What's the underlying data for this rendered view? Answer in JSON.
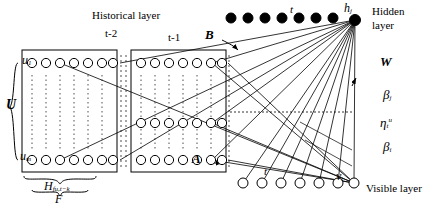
{
  "diagram": {
    "labels": {
      "historical_layer": "Historical layer",
      "t_minus_2": "t-2",
      "t_minus_1": "t-1",
      "t_top": "t",
      "hidden_layer_line1": "Hidden",
      "hidden_layer_line2": "layer",
      "visible_layer": "Visible layer",
      "B": "B",
      "W": "W",
      "U": "U",
      "A": "A",
      "t_bottom": "t",
      "h_j": "h",
      "h_j_sub": "j",
      "v_t": "v",
      "v_t_sub": "t",
      "u_1": "u",
      "u_1_sub": "1",
      "u_m": "u",
      "u_m_sub": "m",
      "beta_j": "β",
      "beta_j_sub": "j",
      "eta_t": "η",
      "eta_t_sub": "t",
      "eta_t_sup": "u",
      "beta_i": "β",
      "beta_i_sub": "i",
      "script_H": "H",
      "script_H_sub": "fu,t−k",
      "script_F": "F"
    },
    "nodes": {
      "hidden_filled_count": 9,
      "hidden_row_y": 18,
      "visible_open_count": 7,
      "visible_row_y": 183,
      "history_block1_cols": 11,
      "history_block2_cols": 11,
      "history_rows": 3,
      "open_node_r": 5,
      "filled_node_r": 5
    },
    "colors": {
      "stroke": "#000000",
      "fill_node": "#000000",
      "background": "#ffffff"
    }
  }
}
